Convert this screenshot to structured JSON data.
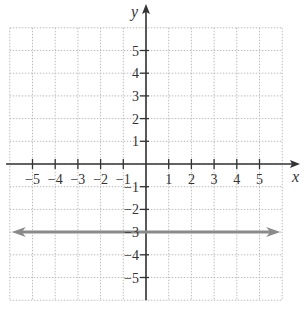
{
  "chart_data": {
    "type": "line",
    "title": "",
    "xlabel": "x",
    "ylabel": "y",
    "xlim": [
      -6,
      6
    ],
    "ylim": [
      -6,
      6
    ],
    "grid": true,
    "x_ticks": [
      -5,
      -4,
      -3,
      -2,
      -1,
      1,
      2,
      3,
      4,
      5
    ],
    "y_ticks": [
      5,
      4,
      3,
      2,
      1,
      -1,
      -2,
      -3,
      -4,
      -5
    ],
    "x_tick_labels": [
      "−5",
      "−4",
      "−3",
      "−2",
      "−1",
      "1",
      "2",
      "3",
      "4",
      "5"
    ],
    "y_tick_labels": [
      "5",
      "4",
      "3",
      "2",
      "1",
      "−1",
      "−2",
      "−3",
      "−4",
      "−5"
    ],
    "series": [
      {
        "name": "y = -3",
        "equation": "y = -3",
        "x": [
          -6,
          6
        ],
        "values": [
          -3,
          -3
        ],
        "color": "#8a8a8a",
        "arrows_both_ends": true
      }
    ]
  },
  "colors": {
    "axis": "#333333",
    "grid": "#bdbdbd",
    "line": "#8a8a8a"
  }
}
